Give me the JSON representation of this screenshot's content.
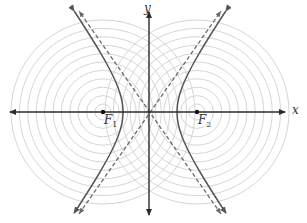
{
  "diagram": {
    "type": "hyperbola-with-focal-circles",
    "labels": {
      "x_axis": "x",
      "y_axis": "y",
      "focus1": "F",
      "focus1_sub": "1",
      "focus2": "F",
      "focus2_sub": "2"
    },
    "geometry": {
      "origin": [
        150,
        112
      ],
      "focus1": [
        103,
        112
      ],
      "focus2": [
        197,
        112
      ],
      "vertex_a": 27,
      "focal_c": 47,
      "circle_count": 11,
      "circle_spacing": 8.4,
      "circle_min_radius": 8
    },
    "colors": {
      "axis": "#2b2b2b",
      "hyperbola": "#555555",
      "asymptote": "#6a6a6a",
      "circles": "#d6d6d6",
      "focus_point": "#111111"
    }
  }
}
